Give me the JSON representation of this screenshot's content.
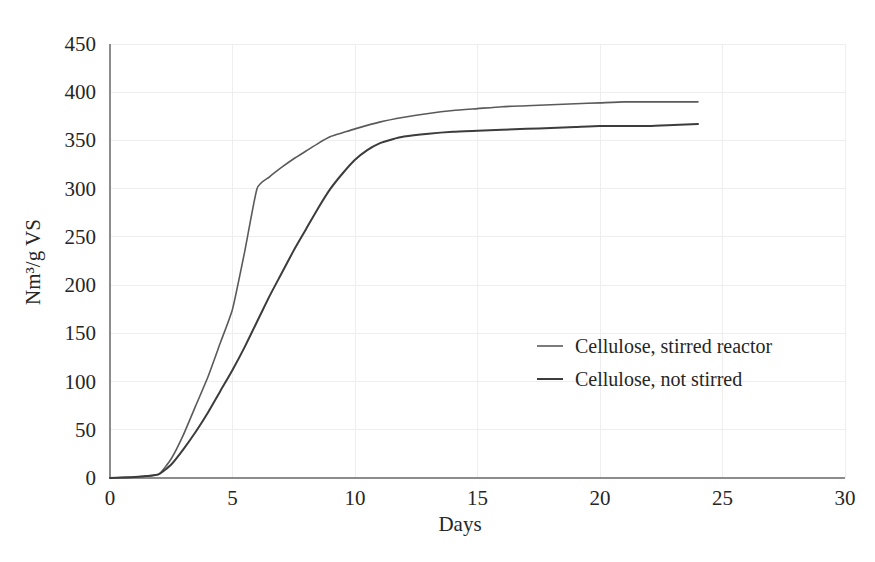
{
  "chart_data": {
    "type": "line",
    "title": "",
    "xlabel": "Days",
    "ylabel": "Nm3/g VS",
    "ylabel_display": "Nm³/g VS",
    "xlim": [
      0,
      30
    ],
    "ylim": [
      0,
      450
    ],
    "xticks": [
      0,
      5,
      10,
      15,
      20,
      25,
      30
    ],
    "yticks": [
      0,
      50,
      100,
      150,
      200,
      250,
      300,
      350,
      400,
      450
    ],
    "xtick_labels": [
      "0",
      "5",
      "10",
      "15",
      "20",
      "25",
      "30"
    ],
    "ytick_labels": [
      "0",
      "50",
      "100",
      "150",
      "200",
      "250",
      "300",
      "350",
      "400",
      "450"
    ],
    "grid": true,
    "grid_color": "#eeeeee",
    "legend_position": "center-right",
    "series": [
      {
        "name": "Cellulose, stirred reactor",
        "color": "#5a5a5a",
        "width": 1.6,
        "x": [
          0,
          0.5,
          1,
          1.5,
          2,
          2.5,
          3,
          3.5,
          4,
          4.5,
          5,
          5.5,
          6,
          6.5,
          7,
          7.5,
          8,
          8.5,
          9,
          9.5,
          10,
          11,
          12,
          13,
          14,
          15,
          16,
          17,
          18,
          19,
          20,
          21,
          22,
          23,
          24
        ],
        "y": [
          0,
          0.5,
          1,
          2,
          4,
          20,
          45,
          75,
          105,
          140,
          175,
          235,
          300,
          312,
          322,
          331,
          339,
          347,
          354,
          358,
          362,
          369,
          374,
          378,
          381,
          383,
          385,
          386,
          387,
          388,
          389,
          390,
          390,
          390,
          390
        ]
      },
      {
        "name": "Cellulose, not stirred",
        "color": "#3c3c3c",
        "width": 2.0,
        "x": [
          0,
          0.5,
          1,
          1.5,
          2,
          2.5,
          3,
          3.5,
          4,
          4.5,
          5,
          5.5,
          6,
          6.5,
          7,
          7.5,
          8,
          8.5,
          9,
          9.5,
          10,
          10.5,
          11,
          11.5,
          12,
          13,
          14,
          15,
          16,
          17,
          18,
          19,
          20,
          21,
          22,
          23,
          24
        ],
        "y": [
          0,
          0.5,
          1,
          2,
          4,
          14,
          30,
          48,
          68,
          90,
          112,
          136,
          162,
          188,
          212,
          236,
          258,
          280,
          300,
          316,
          330,
          340,
          347,
          351,
          354,
          357,
          359,
          360,
          361,
          362,
          363,
          364,
          365,
          365,
          365,
          366,
          367
        ]
      }
    ]
  },
  "legend": {
    "entries": [
      {
        "label": "Cellulose, stirred reactor",
        "color": "#5a5a5a"
      },
      {
        "label": "Cellulose, not stirred",
        "color": "#3c3c3c"
      }
    ]
  },
  "axes": {
    "x_title": "Days",
    "y_title": "Nm³/g VS"
  }
}
